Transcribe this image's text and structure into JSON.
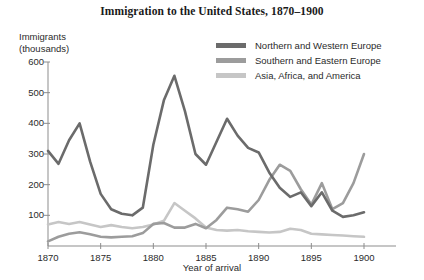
{
  "chart_data": {
    "type": "line",
    "title": "Immigration to the United States, 1870–1900",
    "xlabel": "Year of arrival",
    "ylabel": "Immigrants\n(thousands)",
    "ylabel_lines": [
      "Immigrants",
      "(thousands)"
    ],
    "xlim": [
      1870,
      1900
    ],
    "ylim": [
      0,
      600
    ],
    "yticks": [
      0,
      100,
      200,
      300,
      400,
      500,
      600
    ],
    "ytick_labels": [
      "",
      "100",
      "200",
      "300",
      "400",
      "500",
      "600"
    ],
    "xticks": [
      1870,
      1875,
      1880,
      1885,
      1890,
      1895,
      1900
    ],
    "xtick_labels": [
      "1870",
      "1875",
      "1880",
      "1885",
      "1890",
      "1895",
      "1900"
    ],
    "grid": false,
    "legend_position": "top-right",
    "x": [
      1870,
      1871,
      1872,
      1873,
      1874,
      1875,
      1876,
      1877,
      1878,
      1879,
      1880,
      1881,
      1882,
      1883,
      1884,
      1885,
      1886,
      1887,
      1888,
      1889,
      1890,
      1891,
      1892,
      1893,
      1894,
      1895,
      1896,
      1897,
      1898,
      1899,
      1900
    ],
    "series": [
      {
        "name": "Northern and Western Europe",
        "color": "#6b6b6b",
        "values": [
          310,
          268,
          345,
          400,
          275,
          170,
          120,
          105,
          100,
          125,
          330,
          475,
          555,
          440,
          300,
          265,
          340,
          415,
          360,
          320,
          305,
          240,
          190,
          160,
          175,
          130,
          175,
          115,
          95,
          100,
          110
        ]
      },
      {
        "name": "Southern and Eastern Europe",
        "color": "#9c9c9c",
        "values": [
          15,
          30,
          40,
          45,
          38,
          30,
          28,
          30,
          32,
          42,
          72,
          75,
          60,
          60,
          72,
          58,
          85,
          125,
          120,
          112,
          150,
          215,
          265,
          245,
          185,
          135,
          205,
          120,
          140,
          205,
          300
        ]
      },
      {
        "name": "Asia, Africa, and America",
        "color": "#c6c6c6",
        "values": [
          70,
          78,
          72,
          78,
          70,
          62,
          68,
          62,
          58,
          62,
          70,
          82,
          140,
          115,
          90,
          60,
          52,
          50,
          52,
          48,
          46,
          44,
          46,
          56,
          52,
          40,
          38,
          36,
          34,
          32,
          30
        ]
      }
    ]
  }
}
